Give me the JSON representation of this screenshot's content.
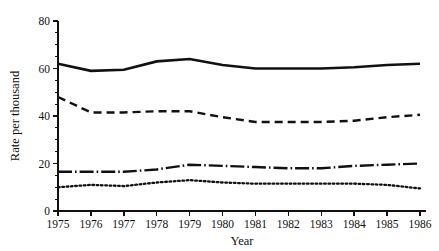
{
  "chart_data": {
    "type": "line",
    "title": "",
    "xlabel": "Year",
    "ylabel": "Rate per thousand",
    "x": [
      1975,
      1976,
      1977,
      1978,
      1979,
      1980,
      1981,
      1982,
      1983,
      1984,
      1985,
      1986
    ],
    "xtick_labels": [
      "1975",
      "1976",
      "1977",
      "1978",
      "1979",
      "1980",
      "1981",
      "1982",
      "1983",
      "1984",
      "1985",
      "1986"
    ],
    "ytick_labels": [
      "0",
      "20",
      "40",
      "60",
      "80"
    ],
    "yticks": [
      0,
      20,
      40,
      60,
      80
    ],
    "yticks_minor": [
      5,
      10,
      15,
      25,
      30,
      35,
      45,
      50,
      55,
      65,
      70,
      75
    ],
    "ylim": [
      0,
      80
    ],
    "xlim": [
      1975,
      1986
    ],
    "grid": false,
    "legend": "none",
    "axis_color": "#111111",
    "series": [
      {
        "name": "series-solid",
        "style": "solid",
        "values": [
          62,
          59,
          59.5,
          63,
          64,
          61.5,
          60,
          60,
          60,
          60.5,
          61.5,
          62
        ]
      },
      {
        "name": "series-dashed",
        "style": "dashed",
        "values": [
          48,
          41.5,
          41.5,
          42,
          42,
          39.5,
          37.5,
          37.5,
          37.5,
          38,
          39.5,
          40.5
        ]
      },
      {
        "name": "series-dash-dot",
        "style": "dash-dot",
        "values": [
          16.5,
          16.5,
          16.5,
          17.5,
          19.5,
          19,
          18.5,
          18,
          18,
          19,
          19.5,
          20
        ]
      },
      {
        "name": "series-dotted",
        "style": "dotted",
        "values": [
          10,
          11,
          10.5,
          12,
          13,
          12,
          11.5,
          11.5,
          11.5,
          11.5,
          11,
          9.5
        ]
      }
    ]
  }
}
